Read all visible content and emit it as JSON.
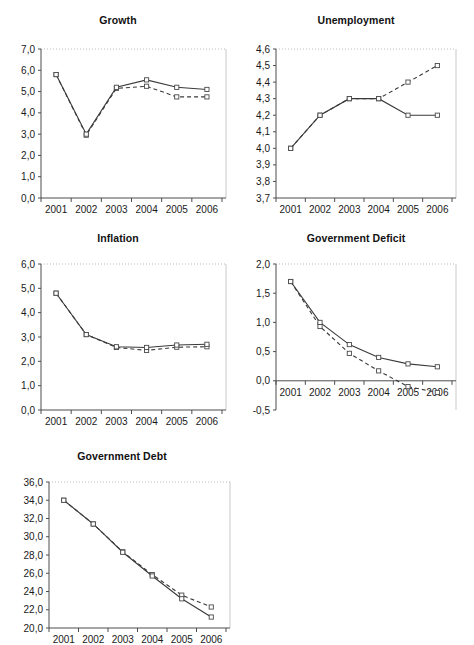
{
  "figure": {
    "panel_count": 5,
    "x_categories": [
      "2001",
      "2002",
      "2003",
      "2004",
      "2005",
      "2006"
    ],
    "marker": "open-square",
    "series_names": [
      "solid",
      "dashed"
    ],
    "colors": {
      "line": "#3a3a3a",
      "marker_fill": "#ffffff",
      "axis": "#4d4d4d",
      "grid": "#b9b9b9"
    }
  },
  "chart_data": [
    {
      "type": "line",
      "title": "Growth",
      "xlabel": "",
      "ylabel": "",
      "categories": [
        "2001",
        "2002",
        "2003",
        "2004",
        "2005",
        "2006"
      ],
      "ylim": [
        0.0,
        7.0
      ],
      "ytick_step": 1.0,
      "ytick_labels": [
        "0,0",
        "1,0",
        "2,0",
        "3,0",
        "4,0",
        "5,0",
        "6,0",
        "7,0"
      ],
      "grid": false,
      "legend": "none",
      "series": [
        {
          "name": "solid",
          "style": "solid",
          "values": [
            5.8,
            3.0,
            5.2,
            5.55,
            5.2,
            5.1
          ]
        },
        {
          "name": "dashed",
          "style": "dashed",
          "values": [
            5.8,
            2.95,
            5.15,
            5.25,
            4.75,
            4.75
          ]
        }
      ]
    },
    {
      "type": "line",
      "title": "Unemployment",
      "xlabel": "",
      "ylabel": "",
      "categories": [
        "2001",
        "2002",
        "2003",
        "2004",
        "2005",
        "2006"
      ],
      "ylim": [
        3.7,
        4.6
      ],
      "ytick_step": 0.1,
      "ytick_labels": [
        "3,7",
        "3,8",
        "3,9",
        "4,0",
        "4,1",
        "4,2",
        "4,3",
        "4,4",
        "4,5",
        "4,6"
      ],
      "grid": false,
      "legend": "none",
      "series": [
        {
          "name": "solid",
          "style": "solid",
          "values": [
            4.0,
            4.2,
            4.3,
            4.3,
            4.2,
            4.2
          ]
        },
        {
          "name": "dashed",
          "style": "dashed",
          "values": [
            4.0,
            4.2,
            4.3,
            4.3,
            4.4,
            4.5
          ]
        }
      ]
    },
    {
      "type": "line",
      "title": "Inflation",
      "xlabel": "",
      "ylabel": "",
      "categories": [
        "2001",
        "2002",
        "2003",
        "2004",
        "2005",
        "2006"
      ],
      "ylim": [
        0.0,
        6.0
      ],
      "ytick_step": 1.0,
      "ytick_labels": [
        "0,0",
        "1,0",
        "2,0",
        "3,0",
        "4,0",
        "5,0",
        "6,0"
      ],
      "grid": false,
      "legend": "none",
      "series": [
        {
          "name": "solid",
          "style": "solid",
          "values": [
            4.8,
            3.1,
            2.6,
            2.57,
            2.67,
            2.7
          ]
        },
        {
          "name": "dashed",
          "style": "dashed",
          "values": [
            4.8,
            3.1,
            2.57,
            2.45,
            2.58,
            2.6
          ]
        }
      ]
    },
    {
      "type": "line",
      "title": "Government Deficit",
      "xlabel": "",
      "ylabel": "",
      "categories": [
        "2001",
        "2002",
        "2003",
        "2004",
        "2005",
        "2006"
      ],
      "ylim": [
        -0.5,
        2.0
      ],
      "ytick_step": 0.5,
      "ytick_labels": [
        "-0,5",
        "0,0",
        "0,5",
        "1,0",
        "1,5",
        "2,0"
      ],
      "zero_axis": 0.0,
      "grid": false,
      "legend": "none",
      "series": [
        {
          "name": "solid",
          "style": "solid",
          "values": [
            1.7,
            1.0,
            0.62,
            0.4,
            0.29,
            0.24
          ]
        },
        {
          "name": "dashed",
          "style": "dashed",
          "values": [
            1.7,
            0.93,
            0.47,
            0.17,
            -0.1,
            -0.2
          ]
        }
      ]
    },
    {
      "type": "line",
      "title": "Government Debt",
      "xlabel": "",
      "ylabel": "",
      "categories": [
        "2001",
        "2002",
        "2003",
        "2004",
        "2005",
        "2006"
      ],
      "ylim": [
        20.0,
        36.0
      ],
      "ytick_step": 2.0,
      "ytick_labels": [
        "20,0",
        "22,0",
        "24,0",
        "26,0",
        "28,0",
        "30,0",
        "32,0",
        "34,0",
        "36,0"
      ],
      "grid": false,
      "legend": "none",
      "series": [
        {
          "name": "solid",
          "style": "solid",
          "values": [
            34.0,
            31.4,
            28.3,
            25.7,
            23.2,
            21.2
          ]
        },
        {
          "name": "dashed",
          "style": "dashed",
          "values": [
            34.0,
            31.4,
            28.35,
            25.85,
            23.6,
            22.3
          ]
        }
      ]
    }
  ]
}
